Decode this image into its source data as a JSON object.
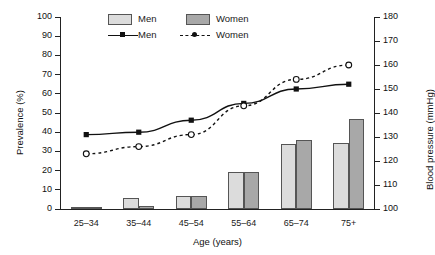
{
  "chart_data": {
    "type": "bar",
    "title": "",
    "xlabel": "Age (years)",
    "ylabel": "Prevalence (%)",
    "y2label": "Blood pressure (mmHg)",
    "categories": [
      "25–34",
      "35–44",
      "45–54",
      "55–64",
      "65–74",
      "75+"
    ],
    "ylim": [
      0,
      100
    ],
    "yticks": [
      0,
      10,
      20,
      30,
      40,
      50,
      60,
      70,
      80,
      90,
      100
    ],
    "y2lim": [
      100,
      180
    ],
    "y2ticks": [
      100,
      110,
      120,
      130,
      140,
      150,
      160,
      170,
      180
    ],
    "grid": false,
    "legend_position": "top-center",
    "series": [
      {
        "name": "Men",
        "kind": "bar",
        "axis": "left",
        "unit": "%",
        "values": [
          1,
          5.5,
          7,
          19.5,
          34,
          34.5
        ]
      },
      {
        "name": "Women",
        "kind": "bar",
        "axis": "left",
        "unit": "%",
        "values": [
          1,
          1.5,
          7,
          19.5,
          36,
          47
        ]
      },
      {
        "name": "Men",
        "kind": "line",
        "axis": "right",
        "unit": "mmHg",
        "style": "solid",
        "marker": "square",
        "values": [
          131,
          132,
          137,
          144,
          150,
          152
        ]
      },
      {
        "name": "Women",
        "kind": "line",
        "axis": "right",
        "unit": "mmHg",
        "style": "dashed",
        "marker": "circle-open",
        "values": [
          123,
          126,
          131,
          143,
          154,
          160
        ]
      }
    ],
    "legend_bar_entries": [
      {
        "label": "Men",
        "color": "#dcdcdc"
      },
      {
        "label": "Women",
        "color": "#a8a8a8"
      }
    ],
    "legend_line_entries": [
      {
        "label": "Men",
        "style": "solid",
        "marker": "square"
      },
      {
        "label": "Women",
        "style": "dashed",
        "marker": "circle-open"
      }
    ]
  },
  "colors": {
    "bar_men": "#dcdcdc",
    "bar_women": "#a8a8a8",
    "axis": "#222222",
    "line": "#111111",
    "background": "#ffffff"
  }
}
